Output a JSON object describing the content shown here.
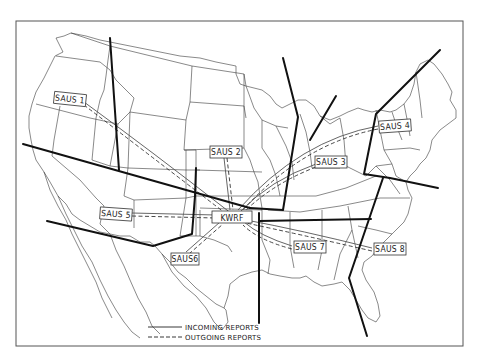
{
  "map": {
    "colors": {
      "background": "#ffffff",
      "state_lines": "#3a3a3a",
      "boundary_lines": "#111111",
      "report_lines": "#555555"
    },
    "hub": {
      "label": "KWRF",
      "x": 232,
      "y": 217
    },
    "stations": [
      {
        "id": "saus1",
        "label": "SAUS 1",
        "x": 68,
        "y": 100
      },
      {
        "id": "saus2",
        "label": "SAUS 2",
        "x": 224,
        "y": 152
      },
      {
        "id": "saus3",
        "label": "SAUS 3",
        "x": 330,
        "y": 162
      },
      {
        "id": "saus4",
        "label": "SAUS 4",
        "x": 394,
        "y": 126
      },
      {
        "id": "saus5",
        "label": "SAUS 5",
        "x": 114,
        "y": 213
      },
      {
        "id": "saus6",
        "label": "SAUS6",
        "x": 182,
        "y": 259
      },
      {
        "id": "saus7",
        "label": "SAUS 7",
        "x": 308,
        "y": 247
      },
      {
        "id": "saus8",
        "label": "SAUS 8",
        "x": 388,
        "y": 249
      }
    ],
    "legend": {
      "incoming": "INCOMING REPORTS",
      "outgoing": "OUTGOING REPORTS"
    }
  }
}
